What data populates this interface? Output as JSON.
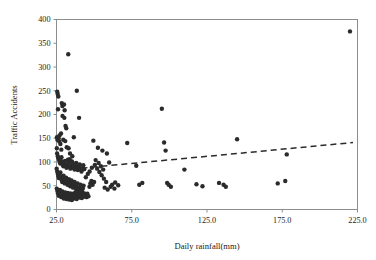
{
  "chart_data": {
    "type": "scatter",
    "title": "",
    "xlabel": "Daily rainfall(mm)",
    "ylabel": "Traffic Accidents",
    "xlim": [
      25.0,
      225.0
    ],
    "ylim": [
      0,
      400
    ],
    "xticks": [
      25.0,
      75.0,
      125.0,
      175.0,
      225.0
    ],
    "yticks": [
      0,
      50,
      100,
      150,
      200,
      250,
      300,
      350,
      400
    ],
    "xtick_labels": [
      "25.0",
      "75.0",
      "125.0",
      "175.0",
      "225.0"
    ],
    "ytick_labels": [
      "0",
      "50",
      "100",
      "150",
      "200",
      "250",
      "300",
      "350",
      "400"
    ],
    "grid": false,
    "legend": false,
    "legend_position": "none",
    "marker_color": "#2b2b2b",
    "marker_size": 3.3,
    "frame_color": "#8d8d8d",
    "background_color": "#ffffff",
    "series": [
      {
        "name": "Daily rainfall vs Traffic Accidents",
        "marker": "filled-circle",
        "points": [
          [
            25.5,
            248
          ],
          [
            25.8,
            243
          ],
          [
            26.2,
            238
          ],
          [
            26.0,
            211
          ],
          [
            28.5,
            224
          ],
          [
            28.9,
            218
          ],
          [
            30.0,
            221
          ],
          [
            30.4,
            209
          ],
          [
            29.0,
            197
          ],
          [
            30.2,
            193
          ],
          [
            31.0,
            176
          ],
          [
            31.5,
            171
          ],
          [
            25.3,
            152
          ],
          [
            25.6,
            147
          ],
          [
            26.4,
            150
          ],
          [
            27.0,
            156
          ],
          [
            28.0,
            160
          ],
          [
            26.8,
            143
          ],
          [
            27.6,
            138
          ],
          [
            25.2,
            129
          ],
          [
            28.2,
            126
          ],
          [
            29.5,
            147
          ],
          [
            30.8,
            144
          ],
          [
            31.8,
            131
          ],
          [
            32.8,
            327
          ],
          [
            38.5,
            250
          ],
          [
            40.0,
            193
          ],
          [
            36.5,
            152
          ],
          [
            33.0,
            129
          ],
          [
            34.0,
            118
          ],
          [
            35.5,
            112
          ],
          [
            33.8,
            106
          ],
          [
            25.4,
            118
          ],
          [
            25.9,
            112
          ],
          [
            26.3,
            108
          ],
          [
            26.7,
            104
          ],
          [
            27.1,
            100
          ],
          [
            27.5,
            97
          ],
          [
            27.9,
            103
          ],
          [
            28.3,
            110
          ],
          [
            28.7,
            99
          ],
          [
            29.1,
            94
          ],
          [
            29.6,
            91
          ],
          [
            30.1,
            96
          ],
          [
            30.6,
            102
          ],
          [
            31.1,
            92
          ],
          [
            31.6,
            88
          ],
          [
            32.1,
            95
          ],
          [
            32.6,
            105
          ],
          [
            33.1,
            99
          ],
          [
            33.6,
            90
          ],
          [
            34.2,
            86
          ],
          [
            34.8,
            93
          ],
          [
            35.3,
            101
          ],
          [
            35.9,
            97
          ],
          [
            36.4,
            89
          ],
          [
            37.0,
            84
          ],
          [
            37.6,
            92
          ],
          [
            38.1,
            98
          ],
          [
            38.7,
            88
          ],
          [
            39.2,
            83
          ],
          [
            39.8,
            90
          ],
          [
            40.4,
            95
          ],
          [
            41.0,
            86
          ],
          [
            41.6,
            80
          ],
          [
            42.2,
            87
          ],
          [
            42.8,
            93
          ],
          [
            43.4,
            85
          ],
          [
            25.1,
            86
          ],
          [
            25.5,
            80
          ],
          [
            25.9,
            75
          ],
          [
            26.3,
            70
          ],
          [
            26.7,
            66
          ],
          [
            27.2,
            72
          ],
          [
            27.6,
            78
          ],
          [
            28.0,
            68
          ],
          [
            28.4,
            62
          ],
          [
            28.8,
            58
          ],
          [
            29.2,
            64
          ],
          [
            29.7,
            71
          ],
          [
            30.1,
            60
          ],
          [
            30.5,
            55
          ],
          [
            31.0,
            61
          ],
          [
            31.4,
            67
          ],
          [
            31.9,
            57
          ],
          [
            32.3,
            52
          ],
          [
            32.8,
            58
          ],
          [
            33.2,
            64
          ],
          [
            33.7,
            54
          ],
          [
            34.1,
            49
          ],
          [
            34.6,
            55
          ],
          [
            35.0,
            61
          ],
          [
            35.5,
            51
          ],
          [
            36.0,
            46
          ],
          [
            36.5,
            52
          ],
          [
            37.0,
            58
          ],
          [
            37.5,
            48
          ],
          [
            38.0,
            43
          ],
          [
            38.5,
            49
          ],
          [
            39.0,
            55
          ],
          [
            39.5,
            45
          ],
          [
            40.0,
            40
          ],
          [
            40.5,
            46
          ],
          [
            41.0,
            52
          ],
          [
            41.5,
            42
          ],
          [
            42.0,
            38
          ],
          [
            42.5,
            44
          ],
          [
            43.0,
            50
          ],
          [
            25.2,
            44
          ],
          [
            25.6,
            39
          ],
          [
            26.0,
            34
          ],
          [
            26.5,
            29
          ],
          [
            26.9,
            35
          ],
          [
            27.3,
            41
          ],
          [
            27.8,
            31
          ],
          [
            28.2,
            26
          ],
          [
            28.6,
            32
          ],
          [
            29.0,
            38
          ],
          [
            29.5,
            28
          ],
          [
            29.9,
            23
          ],
          [
            30.3,
            30
          ],
          [
            30.8,
            36
          ],
          [
            31.2,
            27
          ],
          [
            31.7,
            22
          ],
          [
            32.1,
            29
          ],
          [
            32.5,
            35
          ],
          [
            33.0,
            25
          ],
          [
            33.4,
            21
          ],
          [
            33.9,
            28
          ],
          [
            34.3,
            34
          ],
          [
            34.8,
            24
          ],
          [
            35.2,
            20
          ],
          [
            35.7,
            27
          ],
          [
            36.1,
            33
          ],
          [
            36.6,
            23
          ],
          [
            37.1,
            30
          ],
          [
            37.5,
            36
          ],
          [
            38.0,
            26
          ],
          [
            38.4,
            22
          ],
          [
            38.9,
            29
          ],
          [
            39.4,
            35
          ],
          [
            39.9,
            25
          ],
          [
            40.3,
            31
          ],
          [
            40.8,
            38
          ],
          [
            41.3,
            28
          ],
          [
            41.8,
            24
          ],
          [
            42.3,
            32
          ],
          [
            42.9,
            27
          ],
          [
            43.5,
            34
          ],
          [
            44.2,
            30
          ],
          [
            44.9,
            26
          ],
          [
            45.5,
            33
          ],
          [
            46.2,
            28
          ],
          [
            46.9,
            48
          ],
          [
            47.5,
            55
          ],
          [
            48.2,
            60
          ],
          [
            49.0,
            52
          ],
          [
            50.0,
            58
          ],
          [
            44.5,
            68
          ],
          [
            45.8,
            75
          ],
          [
            47.0,
            80
          ],
          [
            48.5,
            88
          ],
          [
            50.5,
            94
          ],
          [
            52.0,
            86
          ],
          [
            53.5,
            79
          ],
          [
            55.0,
            72
          ],
          [
            56.5,
            65
          ],
          [
            58.0,
            58
          ],
          [
            51.0,
            104
          ],
          [
            53.0,
            98
          ],
          [
            54.5,
            91
          ],
          [
            56.0,
            84
          ],
          [
            49.5,
            145
          ],
          [
            52.5,
            130
          ],
          [
            55.5,
            124
          ],
          [
            58.5,
            118
          ],
          [
            60.0,
            99
          ],
          [
            62.0,
            52
          ],
          [
            64.0,
            57
          ],
          [
            66.0,
            51
          ],
          [
            57.0,
            46
          ],
          [
            59.0,
            42
          ],
          [
            61.0,
            48
          ],
          [
            63.5,
            44
          ],
          [
            72.0,
            140
          ],
          [
            78.0,
            92
          ],
          [
            80.0,
            52
          ],
          [
            82.0,
            56
          ],
          [
            95.0,
            212
          ],
          [
            96.5,
            141
          ],
          [
            97.5,
            124
          ],
          [
            98.5,
            56
          ],
          [
            99.5,
            52
          ],
          [
            101.0,
            48
          ],
          [
            110.0,
            84
          ],
          [
            118.0,
            53
          ],
          [
            122.0,
            49
          ],
          [
            133.0,
            56
          ],
          [
            136.0,
            52
          ],
          [
            137.5,
            48
          ],
          [
            145.0,
            148
          ],
          [
            172.0,
            55
          ],
          [
            177.0,
            60
          ],
          [
            178.0,
            116
          ],
          [
            220.0,
            375
          ]
        ]
      }
    ],
    "trendline": {
      "style": "dashed",
      "color": "#2b2b2b",
      "x_start": 35.0,
      "y_start": 85,
      "x_end": 222.0,
      "y_end": 141
    }
  },
  "axes": {
    "x_title": "Daily rainfall(mm)",
    "y_title": "Traffic Accidents"
  }
}
